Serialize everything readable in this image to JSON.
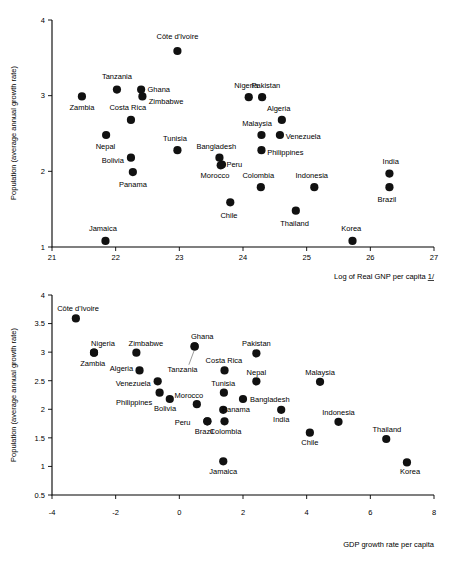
{
  "chart_data": [
    {
      "id": "top",
      "type": "scatter",
      "title": "",
      "xlabel": "Log of Real GNP per capita 1/",
      "ylabel": "Population (average annual growth rate)",
      "xlabel_suffix": "1/",
      "xlabel_main": "Log of Real GNP per capita ",
      "xlim": [
        21,
        27
      ],
      "ylim": [
        1,
        4
      ],
      "xticks": [
        "21",
        "22",
        "23",
        "24",
        "25",
        "26",
        "27"
      ],
      "yticks": [
        "1",
        "2",
        "3",
        "4"
      ],
      "xtick_values": [
        21,
        22,
        23,
        24,
        25,
        26,
        27
      ],
      "ytick_values": [
        1,
        2,
        3,
        4
      ],
      "grid": false,
      "legend": "none",
      "points": [
        {
          "label": "Côte d'Ivoire",
          "x": 22.97,
          "y": 3.59,
          "lx": 22.97,
          "ly": 3.78,
          "anchor": "middle"
        },
        {
          "label": "Zambia",
          "x": 21.47,
          "y": 2.99,
          "lx": 21.47,
          "ly": 2.84,
          "anchor": "middle"
        },
        {
          "label": "Tanzania",
          "x": 22.02,
          "y": 3.08,
          "lx": 22.02,
          "ly": 3.26,
          "anchor": "middle"
        },
        {
          "label": "Ghana",
          "x": 22.4,
          "y": 3.08,
          "lx": 22.5,
          "ly": 3.08,
          "anchor": "start"
        },
        {
          "label": "Zimbabwe",
          "x": 22.42,
          "y": 2.99,
          "lx": 22.52,
          "ly": 2.92,
          "anchor": "start"
        },
        {
          "label": "Costa Rica",
          "x": 22.24,
          "y": 2.68,
          "lx": 22.19,
          "ly": 2.84,
          "anchor": "middle"
        },
        {
          "label": "Nepal",
          "x": 21.85,
          "y": 2.48,
          "lx": 21.84,
          "ly": 2.33,
          "anchor": "middle"
        },
        {
          "label": "Bolivia",
          "x": 22.24,
          "y": 2.18,
          "lx": 22.13,
          "ly": 2.14,
          "anchor": "end"
        },
        {
          "label": "Panama",
          "x": 22.27,
          "y": 1.99,
          "lx": 22.27,
          "ly": 1.83,
          "anchor": "middle"
        },
        {
          "label": "Jamaica",
          "x": 21.84,
          "y": 1.08,
          "lx": 21.8,
          "ly": 1.24,
          "anchor": "middle"
        },
        {
          "label": "Tunisia",
          "x": 22.97,
          "y": 2.28,
          "lx": 22.93,
          "ly": 2.44,
          "anchor": "middle"
        },
        {
          "label": "Bangladesh",
          "x": 23.63,
          "y": 2.18,
          "lx": 23.58,
          "ly": 2.33,
          "anchor": "middle"
        },
        {
          "label": "Peru",
          "x": 23.67,
          "y": 2.09,
          "lx": 23.74,
          "ly": 2.09,
          "anchor": "start"
        },
        {
          "label": "Morocco",
          "x": 23.65,
          "y": 2.08,
          "lx": 23.56,
          "ly": 1.94,
          "anchor": "middle"
        },
        {
          "label": "Chile",
          "x": 23.8,
          "y": 1.59,
          "lx": 23.78,
          "ly": 1.42,
          "anchor": "middle"
        },
        {
          "label": "Nigeria",
          "x": 24.09,
          "y": 2.98,
          "lx": 24.05,
          "ly": 3.14,
          "anchor": "middle"
        },
        {
          "label": "Pakistan",
          "x": 24.3,
          "y": 2.98,
          "lx": 24.36,
          "ly": 3.14,
          "anchor": "middle"
        },
        {
          "label": "Malaysia",
          "x": 24.29,
          "y": 2.48,
          "lx": 24.22,
          "ly": 2.63,
          "anchor": "middle"
        },
        {
          "label": "Algeria",
          "x": 24.61,
          "y": 2.68,
          "lx": 24.56,
          "ly": 2.83,
          "anchor": "middle"
        },
        {
          "label": "Venezuela",
          "x": 24.58,
          "y": 2.48,
          "lx": 24.67,
          "ly": 2.46,
          "anchor": "start"
        },
        {
          "label": "Philippines",
          "x": 24.29,
          "y": 2.28,
          "lx": 24.38,
          "ly": 2.25,
          "anchor": "start"
        },
        {
          "label": "Colombia",
          "x": 24.28,
          "y": 1.79,
          "lx": 24.24,
          "ly": 1.95,
          "anchor": "middle"
        },
        {
          "label": "Indonesia",
          "x": 25.12,
          "y": 1.79,
          "lx": 25.08,
          "ly": 1.95,
          "anchor": "middle"
        },
        {
          "label": "Thailand",
          "x": 24.83,
          "y": 1.48,
          "lx": 24.81,
          "ly": 1.31,
          "anchor": "middle"
        },
        {
          "label": "Korea",
          "x": 25.72,
          "y": 1.08,
          "lx": 25.7,
          "ly": 1.25,
          "anchor": "middle"
        },
        {
          "label": "India",
          "x": 26.3,
          "y": 1.97,
          "lx": 26.32,
          "ly": 2.13,
          "anchor": "middle"
        },
        {
          "label": "Brazil",
          "x": 26.3,
          "y": 1.79,
          "lx": 26.26,
          "ly": 1.63,
          "anchor": "middle"
        }
      ],
      "leaders": []
    },
    {
      "id": "bottom",
      "type": "scatter",
      "title": "",
      "xlabel": "GDP growth rate per capita",
      "ylabel": "Population (average annual growth rate)",
      "xlim": [
        -4,
        8
      ],
      "ylim": [
        0.5,
        4
      ],
      "xticks": [
        "-4",
        "-2",
        "0",
        "2",
        "4",
        "6",
        "8"
      ],
      "yticks": [
        "0.5",
        "1",
        "1.5",
        "2",
        "2.5",
        "3",
        "3.5",
        "4"
      ],
      "xtick_values": [
        -4,
        -2,
        0,
        2,
        4,
        6,
        8
      ],
      "ytick_values": [
        0.5,
        1,
        1.5,
        2,
        2.5,
        3,
        3.5,
        4
      ],
      "grid": false,
      "legend": "none",
      "points": [
        {
          "label": "Côte d'Ivoire",
          "x": -3.25,
          "y": 3.59,
          "lx": -3.18,
          "ly": 3.76,
          "anchor": "middle"
        },
        {
          "label": "Zambia",
          "x": -2.68,
          "y": 2.99,
          "lx": -2.72,
          "ly": 2.8,
          "anchor": "middle"
        },
        {
          "label": "Nigeria",
          "x": -2.68,
          "y": 2.99,
          "lx": -2.4,
          "ly": 3.16,
          "anchor": "middle"
        },
        {
          "label": "Zimbabwe",
          "x": -1.35,
          "y": 2.99,
          "lx": -1.05,
          "ly": 3.16,
          "anchor": "middle"
        },
        {
          "label": "Ghana",
          "x": 0.48,
          "y": 3.1,
          "lx": 0.72,
          "ly": 3.28,
          "anchor": "middle"
        },
        {
          "label": "Tanzania",
          "x": 0.48,
          "y": 3.1,
          "lx": 0.1,
          "ly": 2.7,
          "anchor": "middle"
        },
        {
          "label": "Pakistan",
          "x": 2.42,
          "y": 2.98,
          "lx": 2.42,
          "ly": 3.15,
          "anchor": "middle"
        },
        {
          "label": "Algeria",
          "x": -1.25,
          "y": 2.68,
          "lx": -1.45,
          "ly": 2.71,
          "anchor": "end"
        },
        {
          "label": "Costa Rica",
          "x": 1.42,
          "y": 2.68,
          "lx": 1.4,
          "ly": 2.85,
          "anchor": "middle"
        },
        {
          "label": "Venezuela",
          "x": -0.68,
          "y": 2.49,
          "lx": -0.9,
          "ly": 2.46,
          "anchor": "end"
        },
        {
          "label": "Nepal",
          "x": 2.42,
          "y": 2.49,
          "lx": 2.42,
          "ly": 2.65,
          "anchor": "middle"
        },
        {
          "label": "Malaysia",
          "x": 4.42,
          "y": 2.48,
          "lx": 4.42,
          "ly": 2.65,
          "anchor": "middle"
        },
        {
          "label": "Philippines",
          "x": -0.62,
          "y": 2.29,
          "lx": -0.85,
          "ly": 2.12,
          "anchor": "end"
        },
        {
          "label": "Tunisia",
          "x": 1.4,
          "y": 2.29,
          "lx": 1.38,
          "ly": 2.46,
          "anchor": "middle"
        },
        {
          "label": "Bolivia",
          "x": -0.3,
          "y": 2.18,
          "lx": -0.45,
          "ly": 2.02,
          "anchor": "middle"
        },
        {
          "label": "Bangladesh",
          "x": 2.0,
          "y": 2.18,
          "lx": 2.22,
          "ly": 2.17,
          "anchor": "start"
        },
        {
          "label": "Morocco",
          "x": 0.55,
          "y": 2.09,
          "lx": 0.3,
          "ly": 2.25,
          "anchor": "middle"
        },
        {
          "label": "Panama",
          "x": 1.38,
          "y": 1.99,
          "lx": 1.78,
          "ly": 2.0,
          "anchor": "middle"
        },
        {
          "label": "India",
          "x": 3.2,
          "y": 1.99,
          "lx": 3.2,
          "ly": 1.82,
          "anchor": "middle"
        },
        {
          "label": "Peru",
          "x": 0.88,
          "y": 1.79,
          "lx": 0.35,
          "ly": 1.77,
          "anchor": "end"
        },
        {
          "label": "Colombia",
          "x": 1.42,
          "y": 1.79,
          "lx": 1.45,
          "ly": 1.62,
          "anchor": "middle"
        },
        {
          "label": "Indonesia",
          "x": 5.0,
          "y": 1.78,
          "lx": 5.0,
          "ly": 1.95,
          "anchor": "middle"
        },
        {
          "label": "Brazil",
          "x": 0.88,
          "y": 1.79,
          "lx": 0.78,
          "ly": 1.62,
          "anchor": "middle"
        },
        {
          "label": "Chile",
          "x": 4.1,
          "y": 1.59,
          "lx": 4.1,
          "ly": 1.42,
          "anchor": "middle"
        },
        {
          "label": "Thailand",
          "x": 6.5,
          "y": 1.48,
          "lx": 6.52,
          "ly": 1.65,
          "anchor": "middle"
        },
        {
          "label": "Jamaica",
          "x": 1.38,
          "y": 1.09,
          "lx": 1.38,
          "ly": 0.92,
          "anchor": "middle"
        },
        {
          "label": "Korea",
          "x": 7.15,
          "y": 1.07,
          "lx": 7.25,
          "ly": 0.92,
          "anchor": "middle"
        }
      ],
      "leaders": [
        {
          "from_x": 0.3,
          "from_y": 2.78,
          "to_x": 0.46,
          "to_y": 3.02
        }
      ]
    }
  ]
}
